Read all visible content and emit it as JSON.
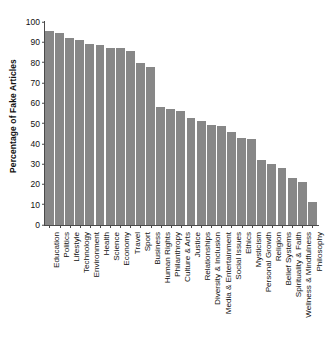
{
  "chart_data": {
    "type": "bar",
    "title": "",
    "xlabel": "",
    "ylabel": "Percentage of Fake Articles",
    "ylim": [
      0,
      100
    ],
    "yticks": [
      0,
      10,
      20,
      30,
      40,
      50,
      60,
      70,
      80,
      90,
      100
    ],
    "grid": false,
    "legend": null,
    "bar_color": "#878787",
    "axis_color": "#4a4a4a",
    "categories": [
      "Education",
      "Politics",
      "Lifestyle",
      "Technology",
      "Environment",
      "Health",
      "Science",
      "Economy",
      "Travel",
      "Sport",
      "Business",
      "Human Rights",
      "Philanthropy",
      "Culture & Arts",
      "Justice",
      "Relationships",
      "Diversity & Inclusion",
      "Media & Entertainment",
      "Social Issues",
      "Ethics",
      "Mysticism",
      "Personal Growth",
      "Religion",
      "Belief Systems",
      "Spirituality & Faith",
      "Wellness & Mindfulness",
      "Philosophy"
    ],
    "values": [
      95.5,
      94.8,
      92.0,
      91.2,
      89.0,
      88.5,
      87.0,
      87.0,
      85.5,
      80.0,
      78.0,
      58.0,
      57.2,
      56.2,
      52.8,
      51.0,
      49.3,
      49.0,
      45.8,
      43.0,
      42.6,
      32.0,
      30.0,
      28.0,
      23.0,
      21.3,
      11.5
    ]
  }
}
